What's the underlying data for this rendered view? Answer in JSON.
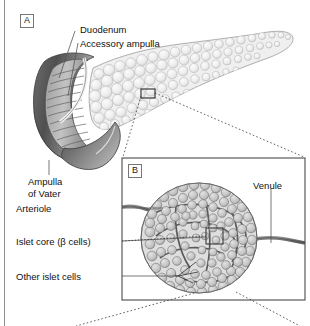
{
  "figure": {
    "type": "anatomical-illustration",
    "panels": [
      {
        "tag": "A",
        "name": "pancreas-duodenum-overview",
        "labels": [
          {
            "id": "duodenum",
            "text": "Duodenum"
          },
          {
            "id": "accessory-ampulla",
            "text": "Accessory ampulla"
          },
          {
            "id": "ampulla-of-vater",
            "text": "Ampulla\nof Vater",
            "line1": "Ampulla",
            "line2": "of Vater"
          }
        ]
      },
      {
        "tag": "B",
        "name": "islet-of-langerhans-detail",
        "labels": [
          {
            "id": "arteriole",
            "text": "Arteriole"
          },
          {
            "id": "islet-core",
            "text": "Islet core (β cells)"
          },
          {
            "id": "other-islet-cells",
            "text": "Other islet cells"
          },
          {
            "id": "venule",
            "text": "Venule"
          }
        ]
      }
    ]
  },
  "colors": {
    "ink": "#1a1a1a",
    "frame": "#4a4a4a",
    "leader": "#555555",
    "pancreas_light": "#e9e9e9",
    "pancreas_outline": "#9a9a9a",
    "duodenum_dark": "#5e5e5e",
    "duodenum_mid": "#8f8f8f",
    "vessel": "#6a6a6a",
    "islet_cell": "#c9c9c9",
    "islet_cell_outline": "#6f6f6f",
    "dotted_callout": "#3a3a3a"
  }
}
